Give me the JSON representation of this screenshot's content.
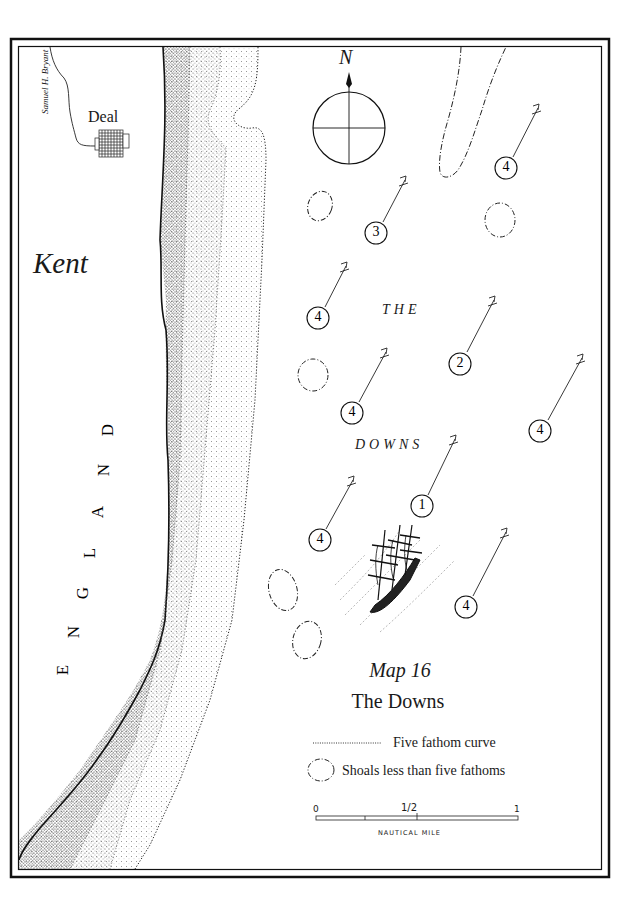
{
  "map": {
    "number_label": "Map 16",
    "title": "The Downs",
    "signature": "Samuel H. Bryant",
    "north_label": "N",
    "places": {
      "county": "Kent",
      "country_letters": [
        "E",
        "N",
        "G",
        "L",
        "A",
        "N",
        "D"
      ],
      "town": "Deal"
    },
    "sea_label_top": "THE",
    "sea_label_bottom": "DOWNS"
  },
  "legend": {
    "items": [
      {
        "symbol": "dotted-line",
        "label": "Five fathom curve"
      },
      {
        "symbol": "dash-dot-oval",
        "label": "Shoals less than five fathoms"
      }
    ]
  },
  "scale_bar": {
    "ticks": [
      "0",
      "1/2",
      "1"
    ],
    "unit": "NAUTICAL MILE"
  },
  "anchorages": [
    {
      "number": "4",
      "x": 506,
      "y": 168
    },
    {
      "number": "3",
      "x": 376,
      "y": 233
    },
    {
      "number": "4",
      "x": 318,
      "y": 318
    },
    {
      "number": "2",
      "x": 460,
      "y": 364
    },
    {
      "number": "4",
      "x": 352,
      "y": 413
    },
    {
      "number": "4",
      "x": 540,
      "y": 431
    },
    {
      "number": "1",
      "x": 422,
      "y": 506
    },
    {
      "number": "4",
      "x": 320,
      "y": 540
    },
    {
      "number": "4",
      "x": 466,
      "y": 607
    }
  ],
  "colors": {
    "ink": "#1a1a1a",
    "paper": "#ffffff"
  }
}
